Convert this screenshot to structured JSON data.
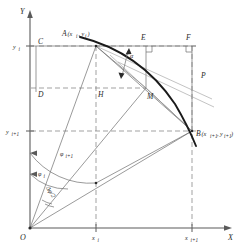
{
  "figure": {
    "type": "geometry-diagram"
  },
  "axes": {
    "y_axis_label": "Y",
    "x_axis_label": "X",
    "origin_label": "O"
  },
  "ticks": {
    "y": [
      {
        "label": "y",
        "sub": "i"
      },
      {
        "label": "y",
        "sub": "i+1"
      }
    ],
    "x": [
      {
        "label": "x",
        "sub": "i"
      },
      {
        "label": "x",
        "sub": "i+1"
      }
    ]
  },
  "points": {
    "A": {
      "name": "A",
      "coords": "(x",
      "sub1": "i",
      "mid": ", y",
      "sub2": "i",
      "close": ")"
    },
    "B": {
      "name": "B",
      "coords": "(x",
      "sub1": "i+1",
      "mid": ", y",
      "sub2": "i+1",
      "close": ")"
    },
    "C": "C",
    "D": "D",
    "E": "E",
    "F": "F",
    "H": "H",
    "M": "M",
    "P": "P"
  },
  "angles": {
    "alpha": "α",
    "phi_i": {
      "glyph": "φ",
      "sub": "i"
    },
    "phi_i1": {
      "glyph": "φ",
      "sub": "i+1"
    },
    "delta_phi_half": "Δφ/2"
  },
  "colors": {
    "curve": "#1a1a1a",
    "axis": "#5a5a5a",
    "dashed": "#7a7a7a",
    "thin": "#6e6e6e",
    "grey": "#9a9a9a",
    "text": "#2b2b2b",
    "background": "#ffffff"
  }
}
